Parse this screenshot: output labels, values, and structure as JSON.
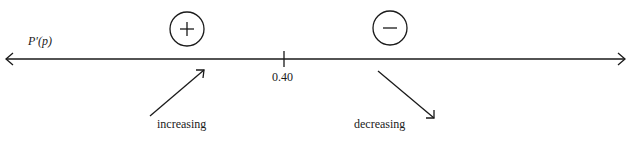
{
  "diagram": {
    "function_label": "P′(p)",
    "critical_value": "0.40",
    "left_sign": "+",
    "right_sign": "−",
    "left_behavior": "increasing",
    "right_behavior": "decreasing",
    "colors": {
      "ink": "#1a1a1a",
      "background": "#ffffff"
    }
  }
}
